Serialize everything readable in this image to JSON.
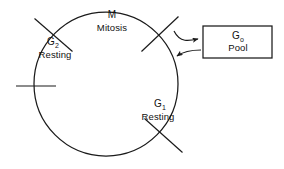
{
  "diagram": {
    "background_color": "#ffffff",
    "line_color": "#1a1a1a",
    "text_color": "#111111",
    "cycle": {
      "shape": "circle",
      "center_x": 106,
      "center_y": 84,
      "radius": 72
    },
    "phases": [
      {
        "key": "mitosis",
        "symbol": "M",
        "subscript": "",
        "name": "Mitosis",
        "label_x": 112,
        "symbol_y": 16,
        "name_y": 28
      },
      {
        "key": "g2",
        "symbol": "G",
        "subscript": "2",
        "name": "Resting",
        "label_x": 53,
        "symbol_y": 42,
        "name_y": 55
      },
      {
        "key": "g1",
        "symbol": "G",
        "subscript": "1",
        "name": "Resting",
        "label_x": 161,
        "symbol_y": 104,
        "name_y": 117
      }
    ],
    "tick_marks": [
      {
        "key": "tick-g2-start",
        "angle_deg": 137,
        "note": "upper-left diagonal"
      },
      {
        "key": "tick-mitosis-end",
        "angle_deg": 47,
        "note": "upper-right diagonal"
      },
      {
        "key": "tick-left",
        "angle_deg": 180,
        "note": "left horizontal"
      },
      {
        "key": "tick-g1-end",
        "angle_deg": -53,
        "note": "lower-right diagonal"
      }
    ],
    "pool_box": {
      "label_symbol": "G",
      "label_subscript": "o",
      "label_name": "Pool",
      "x": 203,
      "y": 26,
      "width": 69,
      "height": 32,
      "symbol_y": 32,
      "name_y": 44,
      "center_x": 238
    },
    "arrows": [
      {
        "key": "arrow-cycle-to-pool",
        "direction": "cycle-to-pool",
        "head": "right"
      },
      {
        "key": "arrow-pool-to-cycle",
        "direction": "pool-to-cycle",
        "head": "left"
      }
    ]
  }
}
